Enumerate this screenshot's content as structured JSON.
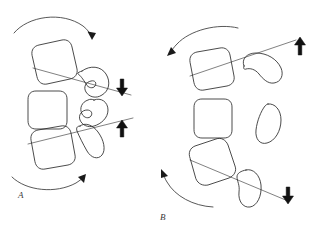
{
  "figure": {
    "title": "",
    "background_color": "#ffffff",
    "ink_color": "#2b2b2b",
    "width": 319,
    "height": 240,
    "panels": [
      {
        "id": "A",
        "label": "A",
        "label_position": {
          "x": 18,
          "y": 196
        },
        "description": "Three rounded squares paired with three blob shapes, connected by two diagonal axis lines, enclosed by two curved rotation arrows and two vertical translation arrows.",
        "squares": [
          {
            "name": "square-top",
            "cx": 50,
            "cy": 62,
            "size": 38,
            "rotation": -14
          },
          {
            "name": "square-middle",
            "cx": 46,
            "cy": 110,
            "size": 38,
            "rotation": 0
          },
          {
            "name": "square-bottom",
            "cx": 50,
            "cy": 148,
            "size": 38,
            "rotation": -12
          }
        ],
        "blobs": [
          {
            "name": "blob-top",
            "cx": 92,
            "cy": 83
          },
          {
            "name": "blob-middle",
            "cx": 92,
            "cy": 118
          },
          {
            "name": "blob-bottom",
            "cx": 96,
            "cy": 142
          }
        ],
        "axis_lines": [
          {
            "name": "axis-line-upper",
            "x1": 33,
            "y1": 68,
            "x2": 131,
            "y2": 95
          },
          {
            "name": "axis-line-lower",
            "x1": 28,
            "y1": 144,
            "x2": 133,
            "y2": 118
          }
        ],
        "curved_arrows": [
          {
            "name": "rotation-arc-top",
            "direction": "clockwise",
            "arrowhead": "right-down"
          },
          {
            "name": "rotation-arc-bottom",
            "direction": "counter-clockwise",
            "arrowhead": "up-right"
          }
        ],
        "straight_arrows": [
          {
            "name": "translation-arrow-down",
            "direction": "down",
            "x": 122,
            "y": 88
          },
          {
            "name": "translation-arrow-up",
            "direction": "up",
            "x": 122,
            "y": 128
          }
        ]
      },
      {
        "id": "B",
        "label": "B",
        "label_position": {
          "x": 160,
          "y": 218
        },
        "description": "Mirror configuration: three rounded squares, three blobs, two diagonal axis lines, two curved rotation arrows pointing left, and up/down translation arrows at right.",
        "squares": [
          {
            "name": "square-top",
            "cx": 208,
            "cy": 67,
            "size": 38,
            "rotation": -10
          },
          {
            "name": "square-middle",
            "cx": 212,
            "cy": 119,
            "size": 38,
            "rotation": 0
          },
          {
            "name": "square-bottom",
            "cx": 208,
            "cy": 162,
            "size": 38,
            "rotation": -18
          }
        ],
        "blobs": [
          {
            "name": "blob-top",
            "cx": 258,
            "cy": 65
          },
          {
            "name": "blob-middle",
            "cx": 268,
            "cy": 123
          },
          {
            "name": "blob-bottom",
            "cx": 248,
            "cy": 188
          }
        ],
        "axis_lines": [
          {
            "name": "axis-line-upper",
            "x1": 190,
            "y1": 76,
            "x2": 295,
            "y2": 40
          },
          {
            "name": "axis-line-lower",
            "x1": 190,
            "y1": 160,
            "x2": 288,
            "y2": 200
          }
        ],
        "curved_arrows": [
          {
            "name": "rotation-arc-top",
            "direction": "counter-clockwise",
            "arrowhead": "left-down"
          },
          {
            "name": "rotation-arc-bottom",
            "direction": "counter-clockwise",
            "arrowhead": "up-left"
          }
        ],
        "straight_arrows": [
          {
            "name": "translation-arrow-up",
            "direction": "up",
            "x": 300,
            "y": 45
          },
          {
            "name": "translation-arrow-down",
            "direction": "down",
            "x": 288,
            "y": 196
          }
        ]
      }
    ]
  }
}
